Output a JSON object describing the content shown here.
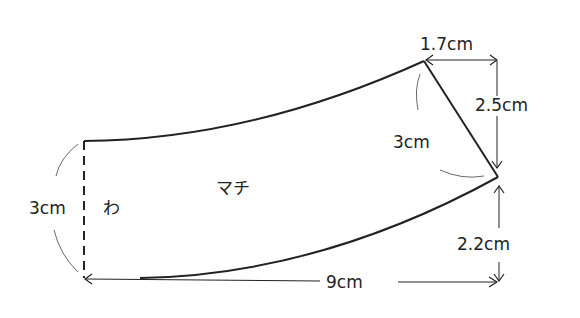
{
  "diagram": {
    "type": "sewing-pattern",
    "part_label": "マチ",
    "fold_label": "わ",
    "dimensions": {
      "left_height": "3cm",
      "top_offset": "1.7cm",
      "right_upper": "2.5cm",
      "slant_edge": "3cm",
      "right_lower": "2.2cm",
      "width": "9cm"
    },
    "colors": {
      "line": "#222222",
      "background": "#ffffff"
    }
  }
}
